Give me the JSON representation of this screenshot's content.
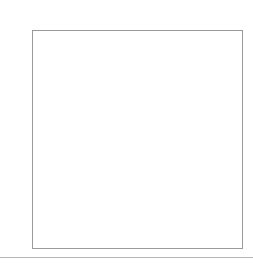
{
  "diagram": {
    "caption": "Diagram 44",
    "column_labels": [
      "100%",
      "90%",
      "80%",
      "70%",
      "60%",
      "50%",
      "40%",
      "30%",
      "20%",
      "10%"
    ],
    "row_labels": [
      "100%",
      "90%",
      "80%",
      "70%",
      "60%",
      "50%",
      "40%",
      "30%",
      "20%",
      "10%"
    ],
    "levels": [
      1.0,
      0.9,
      0.8,
      0.7,
      0.6,
      0.5,
      0.4,
      0.3,
      0.2,
      0.1
    ],
    "strip_density": 0.53,
    "cell_gamma": 1.3,
    "right_strip_color": "#e6e6e6",
    "frame_border_color": "#9a9a9a",
    "rule_color": "#b5b5b5"
  },
  "chart_data": {
    "type": "heatmap",
    "xlabel": "",
    "ylabel": "",
    "x": [
      "100%",
      "90%",
      "80%",
      "70%",
      "60%",
      "50%",
      "40%",
      "30%",
      "20%",
      "10%"
    ],
    "y": [
      "100%",
      "90%",
      "80%",
      "70%",
      "60%",
      "50%",
      "40%",
      "30%",
      "20%",
      "10%"
    ],
    "approx_corner_colors": {
      "top_left": "#1f1f1f",
      "top_right": "#5a5a5a",
      "bottom_left": "#6a6a6a",
      "bottom_right": "#eeeeee"
    }
  }
}
